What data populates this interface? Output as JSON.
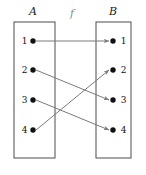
{
  "diagram": {
    "type": "function-mapping-diagram",
    "map_label": "f",
    "colors": {
      "box_stroke": "#4d4d4d",
      "arrow": "#7a7a7a",
      "dot": "#111111",
      "text": "#111111",
      "background": "#ffffff"
    },
    "sets": [
      {
        "id": "A",
        "name": "A",
        "side": "left",
        "elements": [
          {
            "label": "1",
            "cx": 33,
            "cy": 41
          },
          {
            "label": "2",
            "cx": 33,
            "cy": 70
          },
          {
            "label": "3",
            "cx": 33,
            "cy": 100
          },
          {
            "label": "4",
            "cx": 33,
            "cy": 130
          }
        ],
        "box": {
          "x": 14,
          "y": 22,
          "w": 41,
          "h": 136
        }
      },
      {
        "id": "B",
        "name": "B",
        "side": "right",
        "elements": [
          {
            "label": "1",
            "cx": 113,
            "cy": 41
          },
          {
            "label": "2",
            "cx": 113,
            "cy": 70
          },
          {
            "label": "3",
            "cx": 113,
            "cy": 100
          },
          {
            "label": "4",
            "cx": 113,
            "cy": 130
          }
        ],
        "box": {
          "x": 96,
          "y": 22,
          "w": 35,
          "h": 136
        }
      }
    ],
    "arrows": [
      {
        "from": "A1",
        "to": "B1",
        "x1": 36,
        "y1": 41,
        "x2": 109,
        "y2": 41
      },
      {
        "from": "A2",
        "to": "B3",
        "x1": 36,
        "y1": 70,
        "x2": 109,
        "y2": 100
      },
      {
        "from": "A3",
        "to": "B4",
        "x1": 36,
        "y1": 100,
        "x2": 109,
        "y2": 130
      },
      {
        "from": "A4",
        "to": "B2",
        "x1": 36,
        "y1": 130,
        "x2": 109,
        "y2": 70
      }
    ],
    "mapping": [
      {
        "domain": "1",
        "codomain": "1"
      },
      {
        "domain": "2",
        "codomain": "3"
      },
      {
        "domain": "3",
        "codomain": "4"
      },
      {
        "domain": "4",
        "codomain": "2"
      }
    ]
  }
}
